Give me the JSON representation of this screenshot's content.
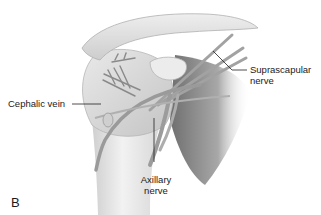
{
  "figure": {
    "panel_letter": "B",
    "colors": {
      "background": "#ffffff",
      "bone_light": "#e6e6e6",
      "bone_mid": "#c9c9c9",
      "shadow": "#8c8c8c",
      "nerve": "#9a9a9a",
      "leader_line": "#222222",
      "text": "#1a1a1a"
    },
    "labels": {
      "cephalic_vein": "Cephalic vein",
      "suprascapular_line1": "Suprascapular",
      "suprascapular_line2": "nerve",
      "axillary_line1": "Axillary",
      "axillary_line2": "nerve"
    }
  }
}
